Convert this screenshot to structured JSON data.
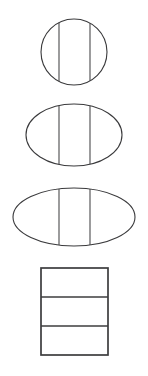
{
  "diagram": {
    "background_color": "#ffffff",
    "stroke_color": "#3a3a3c",
    "figure_count": 4,
    "divisions_per_figure": 3,
    "labels": {
      "figure_1": "circle-divided-in-three",
      "figure_2": "ellipse-medium-divided-in-three",
      "figure_3": "ellipse-wide-divided-in-three",
      "figure_4": "rectangle-divided-in-three"
    }
  },
  "chart_data": {
    "type": "diagram",
    "xlabel": "",
    "ylabel": "",
    "figures": [
      {
        "name": "circle",
        "shape": "ellipse",
        "center_x": 74,
        "center_y": 52,
        "radius_x": 33,
        "radius_y": 33,
        "divider_orientation": "vertical",
        "divider_positions": [
          59,
          90
        ],
        "section_count": 3
      },
      {
        "name": "ellipse-medium",
        "shape": "ellipse",
        "center_x": 74,
        "center_y": 135,
        "radius_x": 48,
        "radius_y": 31,
        "divider_orientation": "vertical",
        "divider_positions": [
          59,
          90
        ],
        "section_count": 3
      },
      {
        "name": "ellipse-wide",
        "shape": "ellipse",
        "center_x": 74,
        "center_y": 217,
        "radius_x": 61,
        "radius_y": 29,
        "divider_orientation": "vertical",
        "divider_positions": [
          59,
          90
        ],
        "section_count": 3
      },
      {
        "name": "rectangle",
        "shape": "rectangle",
        "x": 41,
        "y": 268,
        "width": 67,
        "height": 87,
        "divider_orientation": "horizontal",
        "divider_positions": [
          297,
          326
        ],
        "section_count": 3
      }
    ]
  }
}
